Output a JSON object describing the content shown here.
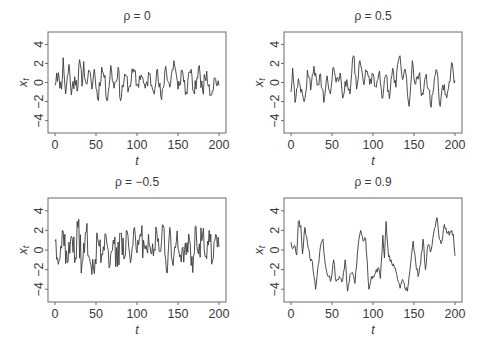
{
  "chart_data": [
    {
      "type": "line",
      "title": "ρ = 0",
      "xlabel": "t",
      "ylabel": "x_t",
      "xlim": [
        0,
        200
      ],
      "ylim": [
        -5.3,
        5.3
      ],
      "xticks": [
        0,
        50,
        100,
        150,
        200
      ],
      "yticks": [
        -4,
        -2,
        0,
        2,
        4
      ],
      "grid": false,
      "rho": 0,
      "seed": 11,
      "anchors": [
        [
          0,
          -0.3
        ],
        [
          2,
          1.0
        ],
        [
          5,
          0.5
        ],
        [
          8,
          -0.7
        ],
        [
          10,
          2.6
        ],
        [
          13,
          -1.2
        ],
        [
          17,
          1.9
        ],
        [
          20,
          -1.3
        ],
        [
          24,
          0.6
        ],
        [
          28,
          -0.4
        ],
        [
          30,
          2.4
        ],
        [
          33,
          -0.4
        ],
        [
          35,
          2.2
        ],
        [
          38,
          -0.1
        ],
        [
          41,
          1.3
        ],
        [
          45,
          -0.7
        ],
        [
          48,
          1.4
        ],
        [
          52,
          -1.8
        ],
        [
          57,
          1.6
        ],
        [
          60,
          0.5
        ],
        [
          64,
          -1.9
        ],
        [
          68,
          1.8
        ],
        [
          72,
          -0.6
        ],
        [
          77,
          1.6
        ],
        [
          80,
          -1.9
        ],
        [
          85,
          0.9
        ],
        [
          90,
          -0.5
        ],
        [
          96,
          1.4
        ],
        [
          100,
          -0.3
        ],
        [
          105,
          0.8
        ],
        [
          110,
          -0.6
        ],
        [
          115,
          0.9
        ],
        [
          120,
          -0.9
        ],
        [
          124,
          1.2
        ],
        [
          130,
          -1.8
        ],
        [
          135,
          1.7
        ],
        [
          140,
          -0.5
        ],
        [
          145,
          2.3
        ],
        [
          150,
          -0.7
        ],
        [
          155,
          1.3
        ],
        [
          160,
          -1.0
        ],
        [
          165,
          1.0
        ],
        [
          170,
          -1.2
        ],
        [
          175,
          1.6
        ],
        [
          180,
          -0.8
        ],
        [
          185,
          1.2
        ],
        [
          190,
          -1.3
        ],
        [
          195,
          0.5
        ],
        [
          200,
          -0.3
        ]
      ]
    },
    {
      "type": "line",
      "title": "ρ = 0.5",
      "xlabel": "t",
      "ylabel": "x_t",
      "xlim": [
        0,
        200
      ],
      "ylim": [
        -5.3,
        5.3
      ],
      "xticks": [
        0,
        50,
        100,
        150,
        200
      ],
      "yticks": [
        -4,
        -2,
        0,
        2,
        4
      ],
      "grid": false,
      "rho": 0.5,
      "seed": 23,
      "anchors": [
        [
          0,
          -1.0
        ],
        [
          2,
          1.5
        ],
        [
          5,
          -2.1
        ],
        [
          9,
          0.4
        ],
        [
          13,
          -0.7
        ],
        [
          17,
          -1.7
        ],
        [
          20,
          1.3
        ],
        [
          24,
          -0.8
        ],
        [
          28,
          1.7
        ],
        [
          32,
          -0.3
        ],
        [
          36,
          0.9
        ],
        [
          40,
          -2.1
        ],
        [
          44,
          0.7
        ],
        [
          48,
          -1.2
        ],
        [
          52,
          1.6
        ],
        [
          56,
          0.5
        ],
        [
          60,
          1.0
        ],
        [
          64,
          -1.4
        ],
        [
          68,
          0.3
        ],
        [
          72,
          -1.2
        ],
        [
          76,
          2.8
        ],
        [
          80,
          -0.7
        ],
        [
          84,
          2.3
        ],
        [
          88,
          0.2
        ],
        [
          92,
          1.1
        ],
        [
          96,
          -0.2
        ],
        [
          100,
          0.9
        ],
        [
          104,
          -0.5
        ],
        [
          108,
          1.2
        ],
        [
          112,
          -1.6
        ],
        [
          116,
          0.8
        ],
        [
          120,
          -1.7
        ],
        [
          124,
          1.5
        ],
        [
          128,
          -0.5
        ],
        [
          132,
          2.7
        ],
        [
          136,
          0.3
        ],
        [
          140,
          1.0
        ],
        [
          144,
          -2.5
        ],
        [
          148,
          2.3
        ],
        [
          152,
          -0.2
        ],
        [
          156,
          0.8
        ],
        [
          160,
          -1.1
        ],
        [
          164,
          0.6
        ],
        [
          168,
          -0.7
        ],
        [
          171,
          -2.6
        ],
        [
          175,
          0.6
        ],
        [
          178,
          1.2
        ],
        [
          182,
          -2.5
        ],
        [
          186,
          -0.8
        ],
        [
          190,
          -1.6
        ],
        [
          194,
          0.1
        ],
        [
          196,
          2.1
        ],
        [
          198,
          0.9
        ],
        [
          200,
          0.2
        ]
      ]
    },
    {
      "type": "line",
      "title": "ρ = −0.5",
      "xlabel": "t",
      "ylabel": "x_t",
      "xlim": [
        0,
        200
      ],
      "ylim": [
        -5.3,
        5.3
      ],
      "xticks": [
        0,
        50,
        100,
        150,
        200
      ],
      "yticks": [
        -4,
        -2,
        0,
        2,
        4
      ],
      "grid": false,
      "rho": -0.5,
      "seed": 37,
      "anchors": [
        [
          0,
          0.9
        ],
        [
          5,
          -1.1
        ],
        [
          10,
          1.9
        ],
        [
          15,
          -1.3
        ],
        [
          20,
          1.4
        ],
        [
          25,
          -0.8
        ],
        [
          28,
          2.3
        ],
        [
          33,
          -1.3
        ],
        [
          38,
          1.8
        ],
        [
          43,
          -1.3
        ],
        [
          48,
          -2.4
        ],
        [
          52,
          1.2
        ],
        [
          57,
          -0.4
        ],
        [
          62,
          1.6
        ],
        [
          67,
          -1.6
        ],
        [
          72,
          0.6
        ],
        [
          76,
          -1.7
        ],
        [
          80,
          1.7
        ],
        [
          85,
          -0.8
        ],
        [
          88,
          1.9
        ],
        [
          92,
          -1.3
        ],
        [
          96,
          2.1
        ],
        [
          100,
          -0.3
        ],
        [
          105,
          1.4
        ],
        [
          110,
          0.1
        ],
        [
          115,
          0.4
        ],
        [
          120,
          -0.6
        ],
        [
          124,
          2.0
        ],
        [
          128,
          -0.2
        ],
        [
          132,
          2.5
        ],
        [
          136,
          -2.3
        ],
        [
          140,
          2.3
        ],
        [
          144,
          -1.6
        ],
        [
          148,
          0.9
        ],
        [
          152,
          -0.7
        ],
        [
          156,
          0.3
        ],
        [
          160,
          -0.5
        ],
        [
          164,
          1.1
        ],
        [
          168,
          -2.3
        ],
        [
          171,
          2.4
        ],
        [
          175,
          -0.4
        ],
        [
          180,
          1.5
        ],
        [
          184,
          -0.6
        ],
        [
          188,
          2.0
        ],
        [
          192,
          -1.1
        ],
        [
          196,
          1.6
        ],
        [
          200,
          0.3
        ]
      ]
    },
    {
      "type": "line",
      "title": "ρ = 0.9",
      "xlabel": "t",
      "ylabel": "x_t",
      "xlim": [
        0,
        200
      ],
      "ylim": [
        -5.3,
        5.3
      ],
      "xticks": [
        0,
        50,
        100,
        150,
        200
      ],
      "yticks": [
        -4,
        -2,
        0,
        2,
        4
      ],
      "grid": false,
      "rho": 0.9,
      "seed": 53,
      "anchors": [
        [
          0,
          0.8
        ],
        [
          3,
          0.2
        ],
        [
          5,
          0.4
        ],
        [
          7,
          -0.5
        ],
        [
          9,
          2.9
        ],
        [
          12,
          2.5
        ],
        [
          14,
          -0.4
        ],
        [
          17,
          2.3
        ],
        [
          20,
          0.8
        ],
        [
          23,
          -0.8
        ],
        [
          26,
          -1.2
        ],
        [
          30,
          -4.0
        ],
        [
          33,
          -1.6
        ],
        [
          36,
          0.4
        ],
        [
          39,
          1.1
        ],
        [
          42,
          -1.6
        ],
        [
          46,
          -2.7
        ],
        [
          49,
          -3.0
        ],
        [
          52,
          -1.0
        ],
        [
          55,
          -3.2
        ],
        [
          59,
          -2.7
        ],
        [
          63,
          -3.1
        ],
        [
          66,
          -1.0
        ],
        [
          69,
          -4.2
        ],
        [
          72,
          -2.5
        ],
        [
          75,
          -2.3
        ],
        [
          78,
          -3.4
        ],
        [
          82,
          0.5
        ],
        [
          85,
          2.0
        ],
        [
          88,
          0.9
        ],
        [
          91,
          1.2
        ],
        [
          95,
          -4.0
        ],
        [
          98,
          -2.7
        ],
        [
          102,
          -2.5
        ],
        [
          106,
          -1.8
        ],
        [
          109,
          -2.9
        ],
        [
          112,
          1.5
        ],
        [
          114,
          -0.8
        ],
        [
          116,
          2.9
        ],
        [
          119,
          -0.7
        ],
        [
          122,
          -1.0
        ],
        [
          126,
          -1.8
        ],
        [
          130,
          -3.0
        ],
        [
          133,
          -3.9
        ],
        [
          136,
          -3.0
        ],
        [
          139,
          -3.9
        ],
        [
          142,
          -4.2
        ],
        [
          146,
          -1.3
        ],
        [
          149,
          0.9
        ],
        [
          152,
          -1.2
        ],
        [
          155,
          -2.7
        ],
        [
          158,
          -1.5
        ],
        [
          161,
          1.1
        ],
        [
          164,
          -2.0
        ],
        [
          167,
          0.5
        ],
        [
          170,
          -0.2
        ],
        [
          173,
          1.2
        ],
        [
          176,
          2.3
        ],
        [
          178,
          3.3
        ],
        [
          181,
          1.1
        ],
        [
          184,
          0.9
        ],
        [
          187,
          2.6
        ],
        [
          190,
          1.7
        ],
        [
          193,
          1.5
        ],
        [
          196,
          2.0
        ],
        [
          198,
          1.6
        ],
        [
          200,
          -0.6
        ]
      ]
    }
  ],
  "panels": [
    {
      "title": "ρ = 0",
      "ylabel": "x",
      "ysub": "t",
      "xlabel": "t"
    },
    {
      "title": "ρ = 0.5",
      "ylabel": "x",
      "ysub": "t",
      "xlabel": "t"
    },
    {
      "title": "ρ = −0.5",
      "ylabel": "x",
      "ysub": "t",
      "xlabel": "t"
    },
    {
      "title": "ρ = 0.9",
      "ylabel": "x",
      "ysub": "t",
      "xlabel": "t"
    }
  ],
  "colors": {
    "line": "#3a3a3a",
    "frame": "#6a6a6a",
    "text": "#3a3a3a"
  }
}
